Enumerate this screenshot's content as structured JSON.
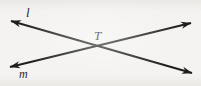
{
  "figure": {
    "kind": "geometry-diagram",
    "background_color": "#f4f3f1",
    "ink_color": "#1d1d1d",
    "width": 201,
    "height": 86,
    "labels": {
      "line_l": "l",
      "line_m": "m",
      "intersection_point": "T"
    },
    "lines": [
      {
        "name": "l",
        "label": "l",
        "stroke": "#1d1d1d",
        "stroke_width": 2,
        "arrowheads": "both",
        "from_x": 11,
        "from_y": 21,
        "to_x": 192,
        "to_y": 73
      },
      {
        "name": "m",
        "label": "m",
        "stroke": "#1d1d1d",
        "stroke_width": 2,
        "arrowheads": "both",
        "from_x": 10,
        "from_y": 67,
        "to_x": 191,
        "to_y": 23
      }
    ],
    "points": [
      {
        "name": "T",
        "label": "T",
        "x": 99,
        "y": 46,
        "label_x": 100,
        "label_y": 35
      }
    ]
  }
}
